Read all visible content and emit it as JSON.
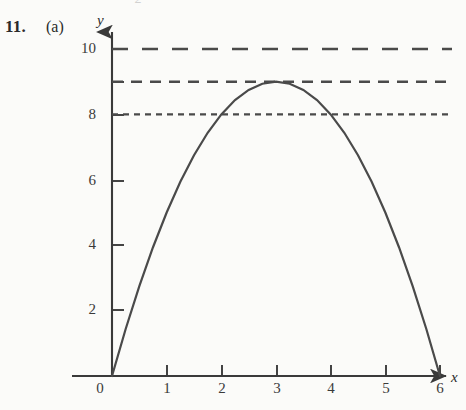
{
  "figure": {
    "problem_number": "11.",
    "problem_part": "(a)",
    "cutoff_text_above": "·  ·  ·      2   ·",
    "axis_labels": {
      "x": "x",
      "y": "y"
    },
    "ink_color": "#3a3a3a",
    "paper_color": "#fbfbf9"
  },
  "chart_data": {
    "type": "line",
    "title": "",
    "subtitle": "",
    "xlabel": "x",
    "ylabel": "y",
    "xlim": [
      0,
      6.4
    ],
    "ylim": [
      0,
      10.6
    ],
    "grid": false,
    "legend": null,
    "x_ticks": [
      {
        "value": 0,
        "label": "0"
      },
      {
        "value": 1,
        "label": "1"
      },
      {
        "value": 2,
        "label": "2"
      },
      {
        "value": 3,
        "label": "3"
      },
      {
        "value": 4,
        "label": "4"
      },
      {
        "value": 5,
        "label": "5"
      },
      {
        "value": 6,
        "label": "6"
      }
    ],
    "y_ticks": [
      {
        "value": 2,
        "label": "2"
      },
      {
        "value": 4,
        "label": "4"
      },
      {
        "value": 6,
        "label": "6"
      },
      {
        "value": 8,
        "label": "8"
      },
      {
        "value": 9,
        "label": ""
      },
      {
        "value": 10,
        "label": "10"
      }
    ],
    "series": [
      {
        "name": "parabola",
        "equation": "y = x(6 - x)",
        "style": "solid",
        "color": "#4a4a4a",
        "vertex": {
          "x": 3,
          "y": 9
        },
        "roots": [
          0,
          6
        ],
        "x": [
          0,
          0.25,
          0.5,
          0.75,
          1,
          1.25,
          1.5,
          1.75,
          2,
          2.25,
          2.5,
          2.75,
          3,
          3.25,
          3.5,
          3.75,
          4,
          4.25,
          4.5,
          4.75,
          5,
          5.25,
          5.5,
          5.75,
          6
        ],
        "values": [
          0,
          1.4375,
          2.75,
          3.9375,
          5,
          5.9375,
          6.75,
          7.4375,
          8,
          8.4375,
          8.75,
          8.9375,
          9,
          8.9375,
          8.75,
          8.4375,
          8,
          7.4375,
          6.75,
          5.9375,
          5,
          3.9375,
          2.75,
          1.4375,
          0
        ]
      }
    ],
    "horizontal_reference_lines": [
      {
        "name": "line-y-10",
        "y": 10,
        "dash_style": "long-dash",
        "label": "10",
        "color": "#4a4a4a"
      },
      {
        "name": "line-y-9",
        "y": 9,
        "dash_style": "medium-dash",
        "label": "",
        "color": "#4a4a4a"
      },
      {
        "name": "line-y-8",
        "y": 8,
        "dash_style": "fine-dot",
        "label": "8",
        "color": "#4a4a4a"
      }
    ],
    "annotations": [
      {
        "name": "vertex-touches-y9",
        "text": "curve maximum touches the y = 9 line at x = 3"
      }
    ]
  }
}
